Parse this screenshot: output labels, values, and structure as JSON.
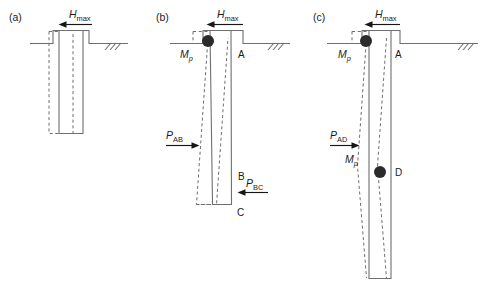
{
  "figure": {
    "background_color": "#ffffff",
    "line_color": "#6f6f6f",
    "arrow_color": "#161616",
    "hinge_color": "#2b2b2b",
    "text_color": "#1a1a1a"
  },
  "panels": [
    {
      "id": "a",
      "label": "(a)",
      "load": {
        "symbol": "H",
        "subscript": "max"
      },
      "point_labels": [],
      "pressure_labels": [],
      "moment_labels": [],
      "hinges": []
    },
    {
      "id": "b",
      "label": "(b)",
      "load": {
        "symbol": "H",
        "subscript": "max"
      },
      "point_labels": [
        "A",
        "B",
        "C"
      ],
      "pressure_labels": [
        {
          "symbol": "P",
          "subscript": "AB"
        },
        {
          "symbol": "P",
          "subscript": "BC"
        }
      ],
      "moment_labels": [
        {
          "symbol": "M",
          "subscript": "p"
        }
      ],
      "hinges": [
        "top"
      ]
    },
    {
      "id": "c",
      "label": "(c)",
      "load": {
        "symbol": "H",
        "subscript": "max"
      },
      "point_labels": [
        "A",
        "D"
      ],
      "pressure_labels": [
        {
          "symbol": "P",
          "subscript": "AD"
        }
      ],
      "moment_labels": [
        {
          "symbol": "M",
          "subscript": "p"
        },
        {
          "symbol": "M",
          "subscript": "p"
        }
      ],
      "hinges": [
        "top",
        "mid"
      ]
    }
  ],
  "labels": {
    "panel_a": "(a)",
    "panel_b": "(b)",
    "panel_c": "(c)",
    "H": "H",
    "max": "max",
    "M": "M",
    "p": "p",
    "P": "P",
    "AB": "AB",
    "BC": "BC",
    "AD": "AD",
    "A": "A",
    "B": "B",
    "C": "C",
    "D": "D"
  }
}
